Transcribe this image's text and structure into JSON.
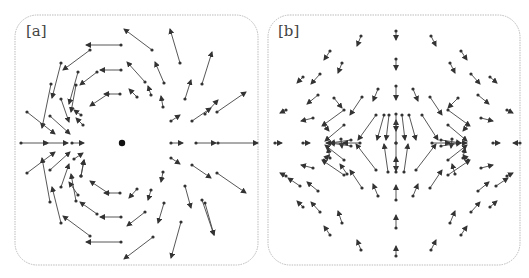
{
  "panels": [
    {
      "label": "[a]",
      "box": {
        "x": 15,
        "y": 15,
        "w": 243,
        "h": 250,
        "r": 22
      },
      "label_pos": {
        "x": 33,
        "y": 33
      },
      "center_dot": {
        "x": 122,
        "y": 143
      },
      "arrows": [
        [
          121,
          45,
          86,
          45
        ],
        [
          152,
          50,
          124,
          29
        ],
        [
          180,
          63,
          170,
          29
        ],
        [
          202,
          84,
          212,
          52
        ],
        [
          90,
          50,
          63,
          70
        ],
        [
          61,
          63,
          52,
          98
        ],
        [
          51,
          84,
          42,
          128
        ],
        [
          121,
          70,
          100,
          70
        ],
        [
          145,
          82,
          127,
          62
        ],
        [
          164,
          83,
          155,
          62
        ],
        [
          185,
          99,
          191,
          80
        ],
        [
          205,
          114,
          218,
          100
        ],
        [
          78,
          72,
          69,
          104
        ],
        [
          97,
          72,
          80,
          85
        ],
        [
          120,
          94,
          104,
          94
        ],
        [
          137,
          97,
          129,
          89
        ],
        [
          151,
          95,
          148,
          86
        ],
        [
          163,
          107,
          161,
          96
        ],
        [
          108,
          94,
          90,
          106
        ],
        [
          76,
          85,
          71,
          112
        ],
        [
          61,
          99,
          69,
          122
        ],
        [
          27,
          112,
          55,
          134
        ],
        [
          50,
          116,
          70,
          134
        ],
        [
          81,
          115,
          74,
          110
        ],
        [
          83,
          125,
          76,
          118
        ],
        [
          171,
          121,
          180,
          115
        ],
        [
          192,
          121,
          211,
          108
        ],
        [
          217,
          112,
          246,
          92
        ],
        [
          21,
          143,
          48,
          143
        ],
        [
          46,
          143,
          68,
          143
        ],
        [
          72,
          143,
          84,
          143
        ],
        [
          171,
          143,
          183,
          143
        ],
        [
          196,
          143,
          216,
          143
        ],
        [
          218,
          143,
          258,
          143
        ],
        [
          171,
          158,
          180,
          164
        ],
        [
          192,
          165,
          211,
          178
        ],
        [
          217,
          173,
          246,
          193
        ],
        [
          27,
          173,
          55,
          152
        ],
        [
          50,
          170,
          70,
          152
        ],
        [
          74,
          159,
          83,
          153
        ],
        [
          81,
          176,
          84,
          160
        ],
        [
          61,
          187,
          69,
          164
        ],
        [
          50,
          202,
          42,
          158
        ],
        [
          61,
          223,
          52,
          187
        ],
        [
          76,
          201,
          71,
          174
        ],
        [
          90,
          236,
          63,
          216
        ],
        [
          81,
          176,
          84,
          160
        ],
        [
          108,
          193,
          90,
          181
        ],
        [
          120,
          193,
          104,
          193
        ],
        [
          137,
          189,
          129,
          198
        ],
        [
          151,
          190,
          148,
          200
        ],
        [
          163,
          172,
          161,
          182
        ],
        [
          97,
          214,
          80,
          202
        ],
        [
          121,
          217,
          100,
          217
        ],
        [
          145,
          212,
          127,
          226
        ],
        [
          164,
          203,
          158,
          223
        ],
        [
          185,
          186,
          191,
          208
        ],
        [
          205,
          203,
          214,
          235
        ],
        [
          121,
          242,
          86,
          242
        ],
        [
          153,
          237,
          124,
          259
        ],
        [
          181,
          222,
          171,
          258
        ],
        [
          202,
          200,
          214,
          235
        ],
        [
          78,
          195,
          69,
          182
        ]
      ]
    },
    {
      "label": "[b]",
      "box": {
        "x": 268,
        "y": 15,
        "w": 252,
        "h": 250,
        "r": 22
      },
      "label_pos": {
        "x": 286,
        "y": 33
      },
      "arrows": [
        [
          396,
          31,
          396,
          40
        ],
        [
          361,
          36,
          357,
          46
        ],
        [
          431,
          36,
          436,
          46
        ],
        [
          330,
          51,
          324,
          60
        ],
        [
          461,
          51,
          467,
          60
        ],
        [
          303,
          77,
          297,
          83
        ],
        [
          490,
          77,
          497,
          83
        ],
        [
          342,
          63,
          338,
          73
        ],
        [
          450,
          63,
          455,
          73
        ],
        [
          396,
          59,
          396,
          70
        ],
        [
          320,
          74,
          311,
          84
        ],
        [
          471,
          74,
          480,
          84
        ],
        [
          396,
          86,
          396,
          100
        ],
        [
          378,
          89,
          373,
          101
        ],
        [
          413,
          89,
          418,
          101
        ],
        [
          286,
          110,
          280,
          113
        ],
        [
          507,
          110,
          513,
          113
        ],
        [
          318,
          95,
          307,
          104
        ],
        [
          478,
          95,
          489,
          104
        ],
        [
          362,
          97,
          350,
          115
        ],
        [
          430,
          97,
          442,
          115
        ],
        [
          334,
          98,
          342,
          108
        ],
        [
          458,
          98,
          448,
          108
        ],
        [
          313,
          118,
          301,
          121
        ],
        [
          481,
          118,
          493,
          121
        ],
        [
          344,
          110,
          322,
          126
        ],
        [
          448,
          110,
          470,
          126
        ],
        [
          389,
          115,
          386,
          140
        ],
        [
          402,
          115,
          405,
          140
        ],
        [
          384,
          115,
          377,
          140
        ],
        [
          409,
          115,
          416,
          140
        ],
        [
          422,
          115,
          438,
          140
        ],
        [
          376,
          115,
          358,
          140
        ],
        [
          344,
          125,
          325,
          141
        ],
        [
          448,
          125,
          467,
          141
        ],
        [
          351,
          140,
          330,
          143
        ],
        [
          441,
          140,
          461,
          143
        ],
        [
          324,
          125,
          329,
          131
        ],
        [
          468,
          125,
          463,
          131
        ],
        [
          341,
          139,
          342,
          148
        ],
        [
          452,
          139,
          451,
          148
        ],
        [
          275,
          143,
          282,
          143
        ],
        [
          303,
          143,
          310,
          143
        ],
        [
          345,
          143,
          326,
          143
        ],
        [
          448,
          143,
          467,
          143
        ],
        [
          493,
          143,
          500,
          143
        ],
        [
          520,
          143,
          513,
          143
        ],
        [
          432,
          143,
          450,
          143
        ],
        [
          360,
          143,
          343,
          143
        ],
        [
          396,
          143,
          396,
          120
        ],
        [
          396,
          143,
          396,
          171
        ],
        [
          396,
          114,
          396,
          131
        ],
        [
          396,
          172,
          396,
          157
        ],
        [
          388,
          172,
          384,
          144
        ],
        [
          404,
          172,
          408,
          144
        ],
        [
          376,
          170,
          356,
          144
        ],
        [
          416,
          170,
          436,
          144
        ],
        [
          351,
          146,
          330,
          143
        ],
        [
          441,
          146,
          461,
          143
        ],
        [
          344,
          160,
          325,
          145
        ],
        [
          448,
          160,
          467,
          145
        ],
        [
          330,
          158,
          328,
          148
        ],
        [
          463,
          158,
          465,
          148
        ],
        [
          324,
          160,
          329,
          155
        ],
        [
          468,
          160,
          463,
          155
        ],
        [
          313,
          168,
          301,
          165
        ],
        [
          481,
          168,
          493,
          165
        ],
        [
          286,
          176,
          280,
          173
        ],
        [
          507,
          176,
          513,
          173
        ],
        [
          318,
          191,
          307,
          182
        ],
        [
          478,
          191,
          489,
          182
        ],
        [
          344,
          175,
          322,
          160
        ],
        [
          448,
          175,
          470,
          160
        ],
        [
          362,
          188,
          350,
          170
        ],
        [
          430,
          188,
          442,
          170
        ],
        [
          347,
          174,
          340,
          164
        ],
        [
          455,
          174,
          452,
          164
        ],
        [
          320,
          212,
          311,
          202
        ],
        [
          471,
          212,
          480,
          202
        ],
        [
          342,
          223,
          338,
          211
        ],
        [
          450,
          223,
          455,
          211
        ],
        [
          396,
          200,
          396,
          185
        ],
        [
          378,
          196,
          373,
          184
        ],
        [
          413,
          196,
          418,
          184
        ],
        [
          303,
          207,
          297,
          201
        ],
        [
          490,
          207,
          497,
          201
        ],
        [
          330,
          235,
          324,
          226
        ],
        [
          461,
          235,
          467,
          226
        ],
        [
          396,
          228,
          396,
          215
        ],
        [
          361,
          250,
          357,
          240
        ],
        [
          431,
          250,
          436,
          240
        ],
        [
          396,
          256,
          396,
          246
        ],
        [
          300,
          186,
          288,
          178
        ],
        [
          496,
          186,
          508,
          178
        ]
      ]
    }
  ]
}
